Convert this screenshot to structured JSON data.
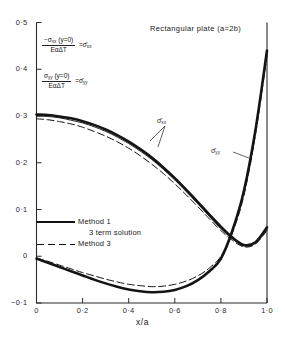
{
  "chart_data": {
    "type": "line",
    "title": "Rectangular plate (a=2b)",
    "xlabel": "x/a",
    "ylabel": "",
    "xlim": [
      0,
      1.0
    ],
    "ylim": [
      -0.1,
      0.5
    ],
    "grid": false,
    "legend_position": "lower-left-inside",
    "xticks": [
      "0",
      "0·2",
      "0·4",
      "0·6",
      "0·8",
      "1·0"
    ],
    "xtick_values": [
      0,
      0.2,
      0.4,
      0.6,
      0.8,
      1.0
    ],
    "yticks": [
      "0·5",
      "0·4",
      "0·3",
      "0·2",
      "0·1",
      "0",
      "−0·1"
    ],
    "ytick_values": [
      0.5,
      0.4,
      0.3,
      0.2,
      0.1,
      0,
      -0.1
    ],
    "series": [
      {
        "name": "sigma-xx Method 1",
        "style": "thick-solid",
        "x": [
          0,
          0.05,
          0.1,
          0.15,
          0.2,
          0.25,
          0.3,
          0.35,
          0.4,
          0.45,
          0.5,
          0.55,
          0.6,
          0.65,
          0.7,
          0.75,
          0.8,
          0.85,
          0.9,
          0.95,
          1.0
        ],
        "values": [
          0.303,
          0.302,
          0.299,
          0.295,
          0.289,
          0.281,
          0.271,
          0.259,
          0.245,
          0.229,
          0.211,
          0.19,
          0.167,
          0.142,
          0.116,
          0.089,
          0.063,
          0.04,
          0.024,
          0.03,
          0.062
        ]
      },
      {
        "name": "sigma-xx 3 term solution",
        "style": "thin-solid",
        "x": [
          0,
          0.05,
          0.1,
          0.15,
          0.2,
          0.25,
          0.3,
          0.35,
          0.4,
          0.45,
          0.5,
          0.55,
          0.6,
          0.65,
          0.7,
          0.75,
          0.8,
          0.85,
          0.9,
          0.95,
          1.0
        ],
        "values": [
          0.3,
          0.299,
          0.296,
          0.291,
          0.285,
          0.277,
          0.267,
          0.255,
          0.241,
          0.225,
          0.207,
          0.186,
          0.163,
          0.138,
          0.112,
          0.085,
          0.059,
          0.037,
          0.022,
          0.028,
          0.058
        ]
      },
      {
        "name": "sigma-xx Method 3",
        "style": "dashed",
        "x": [
          0,
          0.05,
          0.1,
          0.15,
          0.2,
          0.25,
          0.3,
          0.35,
          0.4,
          0.45,
          0.5,
          0.55,
          0.6,
          0.65,
          0.7,
          0.75,
          0.8,
          0.85,
          0.9,
          0.95,
          1.0
        ],
        "values": [
          0.294,
          0.292,
          0.288,
          0.283,
          0.276,
          0.267,
          0.257,
          0.245,
          0.231,
          0.215,
          0.197,
          0.177,
          0.155,
          0.131,
          0.106,
          0.08,
          0.055,
          0.034,
          0.02,
          0.026,
          0.055
        ]
      },
      {
        "name": "sigma-yy Method 1",
        "style": "thick-solid",
        "x": [
          0,
          0.05,
          0.1,
          0.15,
          0.2,
          0.25,
          0.3,
          0.35,
          0.4,
          0.45,
          0.5,
          0.55,
          0.6,
          0.65,
          0.7,
          0.75,
          0.8,
          0.85,
          0.9,
          0.95,
          1.0
        ],
        "values": [
          -0.005,
          -0.014,
          -0.023,
          -0.032,
          -0.041,
          -0.05,
          -0.058,
          -0.065,
          -0.071,
          -0.075,
          -0.077,
          -0.076,
          -0.072,
          -0.064,
          -0.051,
          -0.032,
          -0.005,
          0.055,
          0.14,
          0.27,
          0.44
        ]
      },
      {
        "name": "sigma-yy Method 3",
        "style": "dashed",
        "x": [
          0,
          0.05,
          0.1,
          0.15,
          0.2,
          0.25,
          0.3,
          0.35,
          0.4,
          0.45,
          0.5,
          0.55,
          0.6,
          0.65,
          0.7,
          0.75,
          0.8,
          0.85,
          0.9,
          0.95,
          1.0
        ],
        "values": [
          -0.004,
          -0.011,
          -0.019,
          -0.027,
          -0.035,
          -0.042,
          -0.049,
          -0.055,
          -0.06,
          -0.063,
          -0.065,
          -0.064,
          -0.06,
          -0.053,
          -0.042,
          -0.025,
          0.0,
          0.05,
          0.13,
          0.26,
          0.43
        ]
      }
    ],
    "annotations": [
      {
        "name": "sigma-xx-curve-label",
        "text": "σ̄",
        "sub": "xx"
      },
      {
        "name": "sigma-yy-curve-label",
        "text": "σ̄",
        "sub": "yy"
      }
    ]
  },
  "formulas": {
    "sigma_xx": {
      "numerator": "−σ",
      "numerator_sub": "xx",
      "numerator_arg": "(y=0)",
      "denominator": "EαΔT",
      "equals": "=",
      "result": "σ̄",
      "result_sub": "xx"
    },
    "sigma_yy": {
      "numerator": "σ",
      "numerator_sub": "yy",
      "numerator_arg": "(y=0)",
      "denominator": "EαΔT",
      "equals": "=",
      "result": "σ̄",
      "result_sub": "yy"
    }
  },
  "legend": {
    "items": [
      {
        "label": "Method 1",
        "style": "thick-solid"
      },
      {
        "label": "3 term solution",
        "style": "none"
      },
      {
        "label": "Method 3",
        "style": "dashed"
      }
    ]
  }
}
